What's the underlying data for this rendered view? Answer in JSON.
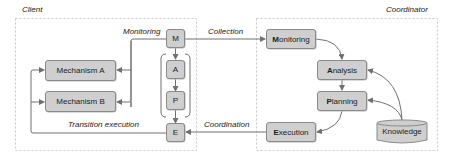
{
  "diagram": {
    "client": {
      "title": "Client",
      "mechanisms": [
        "Mechanism A",
        "Mechanism B"
      ],
      "mape": [
        "M",
        "A",
        "P",
        "E"
      ],
      "labels": {
        "monitoring": "Monitoring",
        "transition_execution": "Transition execution"
      }
    },
    "coordinator": {
      "title": "Coordinator",
      "nodes": {
        "monitoring": {
          "first": "M",
          "rest": "onitoring"
        },
        "analysis": {
          "first": "A",
          "rest": "nalysis"
        },
        "planning": {
          "first": "P",
          "rest": "lanning"
        },
        "execution": {
          "first": "E",
          "rest": "xecution"
        },
        "knowledge": "Knowledge"
      }
    },
    "edges": {
      "collection": "Collection",
      "coordination": "Coordination"
    },
    "colors": {
      "box_fill": "#cfcfcf",
      "box_border": "#8a8a8a",
      "line": "#707070",
      "dashed_border": "#c8c8c8"
    }
  }
}
